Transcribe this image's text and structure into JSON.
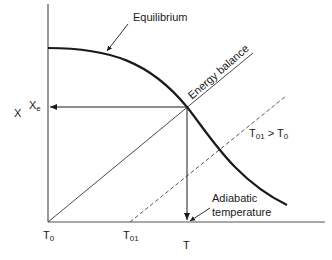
{
  "diagram": {
    "type": "equilibrium-conversion-vs-temperature",
    "axes": {
      "y_label": "X",
      "x_label": "T",
      "y_tick": {
        "base": "X",
        "sub": "e"
      },
      "x_ticks": [
        {
          "base": "T",
          "sub": "0"
        },
        {
          "base": "T",
          "sub": "01"
        }
      ]
    },
    "curves": {
      "equilibrium": {
        "label": "Equilibrium",
        "style": "thick-solid"
      },
      "energy_balance": {
        "label": "Energy balance",
        "style": "thin-solid"
      },
      "energy_balance_shifted": {
        "style": "dashed"
      }
    },
    "annotations": {
      "condition": {
        "base1": "T",
        "sub1": "01",
        "op": " > ",
        "base2": "T",
        "sub2": "0"
      },
      "adiabatic_line1": "Adiabatic",
      "adiabatic_line2": "temperature"
    },
    "colors": {
      "line": "#1a1a1a",
      "axis": "#555555",
      "background": "#ffffff"
    }
  }
}
